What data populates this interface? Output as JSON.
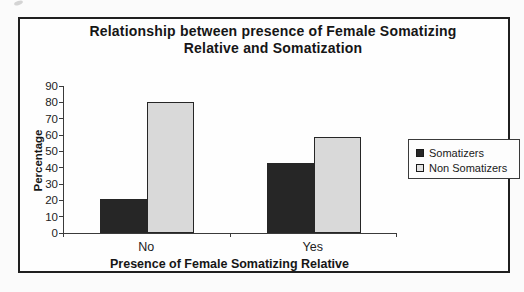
{
  "chart_data": {
    "type": "bar",
    "title": "Relationship between presence of Female Somatizing Relative and Somatization",
    "title_lines": [
      "Relationship between presence of Female Somatizing",
      "Relative and Somatization"
    ],
    "xlabel": "Presence of Female Somatizing Relative",
    "ylabel": "Percentage",
    "categories": [
      "No",
      "Yes"
    ],
    "series": [
      {
        "name": "Somatizers",
        "values": [
          21,
          43
        ],
        "color": "#262626"
      },
      {
        "name": "Non Somatizers",
        "values": [
          80,
          59
        ],
        "color": "#d9d9d9"
      }
    ],
    "ylim": [
      0,
      90
    ],
    "yticks": [
      0,
      10,
      20,
      30,
      40,
      50,
      60,
      70,
      80,
      90
    ],
    "grid": false,
    "legend_position": "right",
    "colors": {
      "bar_border": "#262626",
      "axis": "#3a3a3a"
    }
  }
}
